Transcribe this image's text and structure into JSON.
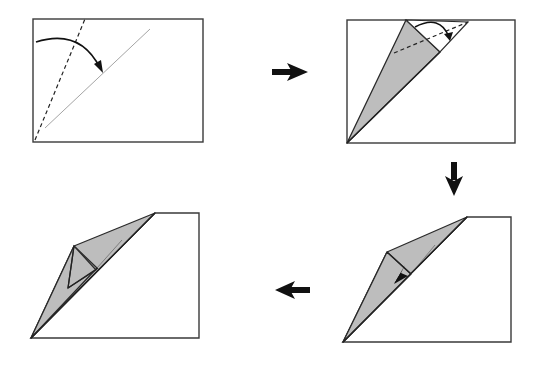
{
  "diagram": {
    "type": "origami-instructions",
    "layout": "2x2 clockwise sequence",
    "colors": {
      "paper": "#ffffff",
      "folded_side": "#bdbdbd",
      "outline": "#2a2a2a",
      "arrow": "#111111"
    },
    "steps": [
      {
        "index": 1,
        "position": "top-left",
        "description": "Fold the left edge along the dashed valley line so it aligns with the diagonal crease",
        "symbols": [
          "valley-fold-line",
          "crease-line",
          "fold-arrow"
        ]
      },
      {
        "index": 2,
        "position": "top-right",
        "description": "Fold the top flap down along the dashed valley line",
        "symbols": [
          "valley-fold-line",
          "fold-arrow"
        ]
      },
      {
        "index": 3,
        "position": "bottom-right",
        "description": "Push the flap inward (squash/reverse fold)",
        "symbols": [
          "push-arrow"
        ]
      },
      {
        "index": 4,
        "position": "bottom-left",
        "description": "Result"
      }
    ],
    "transitions": [
      {
        "from": 1,
        "to": 2,
        "direction": "right"
      },
      {
        "from": 2,
        "to": 3,
        "direction": "down"
      },
      {
        "from": 3,
        "to": 4,
        "direction": "left"
      }
    ]
  }
}
